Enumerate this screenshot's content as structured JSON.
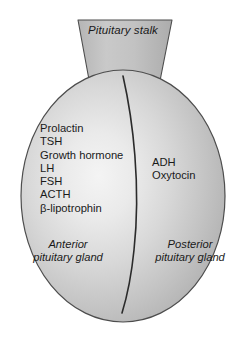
{
  "figure": {
    "background_color": "#ffffff",
    "outline_color": "#4d4d4d",
    "fill_edge_color": "#a9a9a9",
    "fill_center_color": "#f2f2f2",
    "text_color": "#1a1a1a"
  },
  "stalk": {
    "label": "Pituitary stalk"
  },
  "anterior": {
    "hormones": [
      "Prolactin",
      "TSH",
      "Growth hormone",
      "LH",
      "FSH",
      "ACTH",
      "β-lipotrophin"
    ],
    "gland_label_line1": "Anterior",
    "gland_label_line2": "pituitary gland"
  },
  "posterior": {
    "hormones": [
      "ADH",
      "Oxytocin"
    ],
    "gland_label_line1": "Posterior",
    "gland_label_line2": "pituitary gland"
  },
  "divider": {
    "name": "anterior-posterior-divider"
  }
}
